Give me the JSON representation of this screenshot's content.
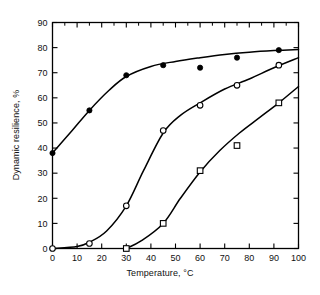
{
  "chart_data": {
    "type": "line",
    "title": "",
    "xlabel": "Temperature, °C",
    "ylabel": "Dynamic resilience, %",
    "xlim": [
      0,
      100
    ],
    "ylim": [
      0,
      90
    ],
    "xticks": [
      0,
      10,
      20,
      30,
      40,
      50,
      60,
      70,
      80,
      90,
      100
    ],
    "yticks": [
      0,
      10,
      20,
      30,
      40,
      50,
      60,
      70,
      80,
      90
    ],
    "grid": false,
    "legend": "none",
    "series": [
      {
        "name": "filled-circle-series",
        "marker": "filled-circle",
        "color": "#000000",
        "points": [
          {
            "x": 0,
            "y": 38
          },
          {
            "x": 15,
            "y": 55
          },
          {
            "x": 30,
            "y": 69
          },
          {
            "x": 45,
            "y": 73
          },
          {
            "x": 60,
            "y": 72
          },
          {
            "x": 75,
            "y": 76
          },
          {
            "x": 92,
            "y": 79
          }
        ],
        "curve": [
          {
            "x": 0,
            "y": 38
          },
          {
            "x": 8,
            "y": 47
          },
          {
            "x": 15,
            "y": 55
          },
          {
            "x": 23,
            "y": 63
          },
          {
            "x": 30,
            "y": 68.5
          },
          {
            "x": 40,
            "y": 72.5
          },
          {
            "x": 50,
            "y": 74.5
          },
          {
            "x": 60,
            "y": 76
          },
          {
            "x": 70,
            "y": 77.3
          },
          {
            "x": 80,
            "y": 78.2
          },
          {
            "x": 90,
            "y": 78.8
          },
          {
            "x": 100,
            "y": 79.2
          }
        ]
      },
      {
        "name": "open-circle-series",
        "marker": "open-circle",
        "color": "#000000",
        "points": [
          {
            "x": 0,
            "y": 0
          },
          {
            "x": 15,
            "y": 2
          },
          {
            "x": 30,
            "y": 17
          },
          {
            "x": 45,
            "y": 47
          },
          {
            "x": 60,
            "y": 57
          },
          {
            "x": 75,
            "y": 65
          },
          {
            "x": 92,
            "y": 73
          }
        ],
        "curve": [
          {
            "x": 0,
            "y": 0
          },
          {
            "x": 10,
            "y": 0.8
          },
          {
            "x": 15,
            "y": 2.5
          },
          {
            "x": 22,
            "y": 7
          },
          {
            "x": 30,
            "y": 17
          },
          {
            "x": 37,
            "y": 31
          },
          {
            "x": 45,
            "y": 46
          },
          {
            "x": 52,
            "y": 53
          },
          {
            "x": 60,
            "y": 58
          },
          {
            "x": 70,
            "y": 63.5
          },
          {
            "x": 80,
            "y": 67.5
          },
          {
            "x": 90,
            "y": 72
          },
          {
            "x": 100,
            "y": 76
          }
        ]
      },
      {
        "name": "open-square-series",
        "marker": "open-square",
        "color": "#000000",
        "points": [
          {
            "x": 30,
            "y": 0
          },
          {
            "x": 45,
            "y": 10
          },
          {
            "x": 60,
            "y": 31
          },
          {
            "x": 75,
            "y": 41
          },
          {
            "x": 92,
            "y": 58
          }
        ],
        "curve": [
          {
            "x": 30,
            "y": 0
          },
          {
            "x": 36,
            "y": 3
          },
          {
            "x": 45,
            "y": 10
          },
          {
            "x": 52,
            "y": 20
          },
          {
            "x": 60,
            "y": 30.5
          },
          {
            "x": 68,
            "y": 39
          },
          {
            "x": 76,
            "y": 46
          },
          {
            "x": 84,
            "y": 52
          },
          {
            "x": 92,
            "y": 58
          },
          {
            "x": 100,
            "y": 64.5
          }
        ]
      }
    ]
  }
}
